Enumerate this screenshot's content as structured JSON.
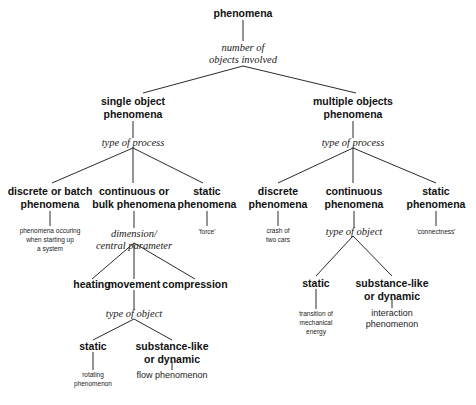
{
  "diagram": {
    "root": {
      "label": "phenomena"
    },
    "root_criterion": {
      "line1": "number of",
      "line2": "objects involved"
    },
    "single": {
      "label_line1": "single object",
      "label_line2": "phenomena",
      "criterion": "type of process",
      "discrete": {
        "label_line1": "discrete or batch",
        "label_line2": "phenomena",
        "example_line1": "phenomena occuring",
        "example_line2": "when starting up",
        "example_line3": "a system"
      },
      "continuous": {
        "label_line1": "continuous or",
        "label_line2": "bulk phenomena",
        "criterion_line1": "dimension/",
        "criterion_line2": "central parameter",
        "heating": "heating",
        "movement": {
          "label": "movement",
          "criterion": "type of object",
          "static": {
            "label": "static",
            "example_line1": "rotating",
            "example_line2": "phenomenon"
          },
          "dynamic": {
            "label_line1": "substance-like",
            "label_line2": "or dynamic",
            "example": "flow phenomenon"
          }
        },
        "compression": "compression"
      },
      "static": {
        "label_line1": "static",
        "label_line2": "phenomena",
        "example": "'force'"
      }
    },
    "multiple": {
      "label_line1": "multiple objects",
      "label_line2": "phenomena",
      "criterion": "type of process",
      "discrete": {
        "label_line1": "discrete",
        "label_line2": "phenomena",
        "example_line1": "crash of",
        "example_line2": "two cars"
      },
      "continuous": {
        "label_line1": "continuous",
        "label_line2": "phenomena",
        "criterion": "type of object",
        "static": {
          "label": "static",
          "example_line1": "transition of",
          "example_line2": "mechanical",
          "example_line3": "energy"
        },
        "dynamic": {
          "label_line1": "substance-like",
          "label_line2": "or dynamic",
          "example_line1": "interaction",
          "example_line2": "phenomenon"
        }
      },
      "static": {
        "label_line1": "static",
        "label_line2": "phenomena",
        "example": "'connectness'"
      }
    }
  }
}
